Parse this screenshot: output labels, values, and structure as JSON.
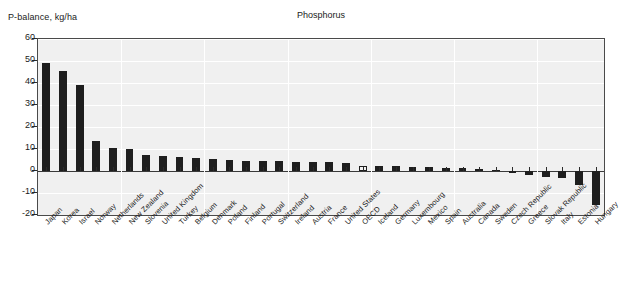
{
  "chart_data": {
    "type": "bar",
    "title": "Phosphorus",
    "ylabel": "P-balance, kg/ha",
    "xlabel": "",
    "ylim": [
      -20,
      60
    ],
    "yticks": [
      60,
      50,
      40,
      30,
      20,
      10,
      0,
      -10,
      -20
    ],
    "grid": true,
    "legend": "none",
    "bar_color": "#1e1e1e",
    "highlight_color": "#f2f2f2",
    "highlight_category": "OECD",
    "categories": [
      "Japan",
      "Korea",
      "Israel",
      "Norway",
      "Netherlands",
      "New Zealand",
      "Slovenia",
      "United Kingdom",
      "Turkey",
      "Belgium",
      "Denmark",
      "Poland",
      "Finland",
      "Portugal",
      "Switzerland",
      "Ireland",
      "Austria",
      "France",
      "United States",
      "OECD",
      "Iceland",
      "Germany",
      "Luxembourg",
      "Mexico",
      "Spain",
      "Australia",
      "Canada",
      "Sweden",
      "Czech Republic",
      "Greece",
      "Slovak Republic",
      "Italy",
      "Estonia",
      "Hungary"
    ],
    "values": [
      49.0,
      45.5,
      39.0,
      13.5,
      10.5,
      10.0,
      7.5,
      7.0,
      6.5,
      6.0,
      5.5,
      5.0,
      4.5,
      4.5,
      4.5,
      4.0,
      4.0,
      4.0,
      3.5,
      2.5,
      2.5,
      2.5,
      2.0,
      2.0,
      1.5,
      1.5,
      1.0,
      0.5,
      -1.0,
      -2.0,
      -2.5,
      -3.0,
      -6.5,
      -15.5
    ]
  },
  "axis": {
    "y_caption": "P-balance, kg/ha"
  }
}
